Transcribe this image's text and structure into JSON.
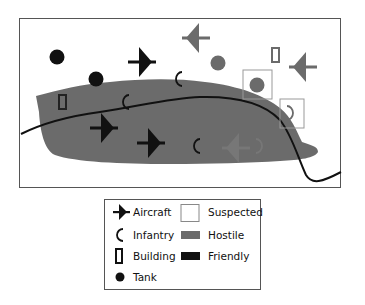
{
  "diagram": {
    "type": "military-map-symbology",
    "colors": {
      "hostile_fill": "#6b6b6b",
      "friendly": "#111111",
      "suspected_border": "#888888",
      "frame": "#555555"
    },
    "symbols": [
      {
        "type": "tank",
        "side": "friendly",
        "x": 57,
        "y": 57
      },
      {
        "type": "tank",
        "side": "friendly",
        "x": 96,
        "y": 79
      },
      {
        "type": "aircraft",
        "side": "friendly",
        "x": 142,
        "y": 62
      },
      {
        "type": "aircraft",
        "side": "hostile",
        "x": 196,
        "y": 38
      },
      {
        "type": "tank",
        "side": "hostile",
        "x": 218,
        "y": 63
      },
      {
        "type": "building",
        "side": "hostile",
        "x": 276,
        "y": 55
      },
      {
        "type": "aircraft",
        "side": "hostile",
        "x": 303,
        "y": 67
      },
      {
        "type": "infantry",
        "side": "friendly",
        "x": 178,
        "y": 78
      },
      {
        "type": "tank",
        "side": "hostile",
        "suspected": true,
        "x": 257,
        "y": 84
      },
      {
        "type": "building",
        "side": "friendly",
        "x": 62,
        "y": 102
      },
      {
        "type": "infantry",
        "side": "friendly",
        "x": 125,
        "y": 101
      },
      {
        "type": "infantry",
        "side": "hostile",
        "suspected": true,
        "x": 291,
        "y": 113
      },
      {
        "type": "aircraft",
        "side": "friendly",
        "x": 104,
        "y": 127
      },
      {
        "type": "aircraft",
        "side": "friendly",
        "x": 151,
        "y": 143
      },
      {
        "type": "infantry",
        "side": "friendly",
        "x": 196,
        "y": 145
      },
      {
        "type": "aircraft",
        "side": "hostile",
        "x": 236,
        "y": 148
      },
      {
        "type": "infantry",
        "side": "hostile",
        "x": 259,
        "y": 145
      }
    ]
  },
  "legend": {
    "items": [
      {
        "key": "aircraft",
        "label": "Aircraft"
      },
      {
        "key": "infantry",
        "label": "Infantry"
      },
      {
        "key": "building",
        "label": "Building"
      },
      {
        "key": "tank",
        "label": "Tank"
      },
      {
        "key": "suspected",
        "label": "Suspected"
      },
      {
        "key": "hostile",
        "label": "Hostile"
      },
      {
        "key": "friendly",
        "label": "Friendly"
      }
    ]
  }
}
